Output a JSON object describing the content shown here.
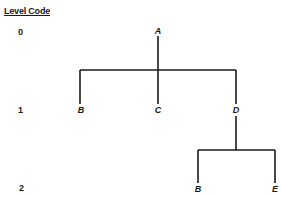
{
  "header": {
    "title": "Level Code"
  },
  "levels": [
    {
      "code": "0"
    },
    {
      "code": "1"
    },
    {
      "code": "2"
    }
  ],
  "tree": {
    "root": {
      "label": "A",
      "level": 0
    },
    "level1": [
      {
        "label": "B"
      },
      {
        "label": "C"
      },
      {
        "label": "D"
      }
    ],
    "level2": [
      {
        "label": "B",
        "parent": "D"
      },
      {
        "label": "E",
        "parent": "D"
      }
    ]
  },
  "colors": {
    "line": "#1a1a1a",
    "background": "#ffffff"
  }
}
